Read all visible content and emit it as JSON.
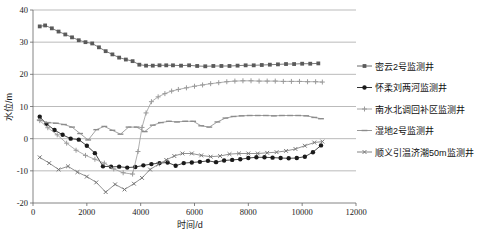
{
  "chart_data": {
    "type": "line",
    "title": "",
    "xlabel": "时间/d",
    "ylabel": "水位/m",
    "xlim": [
      0,
      12000
    ],
    "ylim": [
      -20,
      40
    ],
    "xticks": [
      0,
      2000,
      4000,
      6000,
      8000,
      10000,
      12000
    ],
    "yticks": [
      -20,
      -10,
      0,
      10,
      20,
      30,
      40
    ],
    "xticklabels": [
      "0",
      "2000",
      "4000",
      "6000",
      "8000",
      "10000",
      "12000"
    ],
    "yticklabels": [
      "-20",
      "-10",
      "0",
      "10",
      "20",
      "30",
      "40"
    ],
    "grid": "horizontal",
    "legend_position": "right",
    "series": [
      {
        "name": "密云2号监测井",
        "color": "#5a5a5a",
        "marker": "square",
        "x": [
          250,
          450,
          700,
          950,
          1200,
          1450,
          1700,
          1950,
          2200,
          2450,
          2700,
          2950,
          3200,
          3450,
          3700,
          3950,
          4200,
          4450,
          4700,
          4950,
          5200,
          5500,
          5800,
          6100,
          6400,
          6700,
          7000,
          7300,
          7600,
          7900,
          8200,
          8500,
          8800,
          9100,
          9400,
          9700,
          10000,
          10300,
          10600
        ],
        "y": [
          34.9,
          35.2,
          34.3,
          33.3,
          32.4,
          31.5,
          30.6,
          30.0,
          29.6,
          28.4,
          27.2,
          26.2,
          25.2,
          24.6,
          24.1,
          23.0,
          22.7,
          22.7,
          22.8,
          22.8,
          22.8,
          22.7,
          22.8,
          22.6,
          22.5,
          22.6,
          22.6,
          22.6,
          22.7,
          22.8,
          22.8,
          22.9,
          23.0,
          23.1,
          23.2,
          23.2,
          23.3,
          23.3,
          23.4
        ]
      },
      {
        "name": "怀柔刘两河监测井",
        "color": "#1a1a1a",
        "marker": "circle",
        "x": [
          250,
          500,
          800,
          1100,
          1400,
          1700,
          2000,
          2300,
          2600,
          2900,
          3200,
          3500,
          3800,
          4100,
          4400,
          4700,
          5000,
          5300,
          5600,
          5900,
          6200,
          6500,
          6800,
          7100,
          7400,
          7700,
          8000,
          8300,
          8600,
          8900,
          9200,
          9500,
          9800,
          10100,
          10400,
          10700
        ],
        "y": [
          6.8,
          4.6,
          2.7,
          1.2,
          0.0,
          -0.3,
          -2.2,
          -4.5,
          -8.6,
          -8.7,
          -8.7,
          -9.0,
          -8.8,
          -8.3,
          -7.9,
          -7.6,
          -7.4,
          -8.4,
          -7.6,
          -7.4,
          -7.2,
          -6.9,
          -7.3,
          -6.8,
          -6.6,
          -6.4,
          -6.0,
          -5.8,
          -5.8,
          -5.9,
          -6.0,
          -6.1,
          -6.0,
          -5.6,
          -4.2,
          -2.1
        ]
      },
      {
        "name": "南水北调回补区监测井",
        "color": "#9a9a9a",
        "marker": "plus",
        "x": [
          250,
          550,
          900,
          1250,
          1600,
          1950,
          2300,
          2650,
          3000,
          3350,
          3700,
          3900,
          4050,
          4200,
          4400,
          4650,
          4900,
          5150,
          5400,
          5700,
          6000,
          6300,
          6600,
          6900,
          7200,
          7500,
          7800,
          8100,
          8400,
          8700,
          9000,
          9300,
          9600,
          9900,
          10200,
          10500,
          10750
        ],
        "y": [
          5.6,
          3.4,
          1.2,
          -1.4,
          -3.6,
          -5.2,
          -6.4,
          -7.6,
          -9.4,
          -10.6,
          -11.0,
          -4.0,
          3.5,
          8.0,
          11.5,
          13.0,
          14.0,
          14.8,
          15.3,
          15.8,
          16.3,
          16.7,
          17.1,
          17.4,
          17.7,
          17.9,
          18.0,
          18.0,
          17.9,
          17.9,
          17.9,
          17.8,
          17.8,
          17.8,
          17.7,
          17.7,
          17.6
        ]
      },
      {
        "name": "湿地2号监测井",
        "color": "#8c8c8c",
        "marker": "dash",
        "x": [
          250,
          550,
          850,
          1150,
          1450,
          1750,
          2050,
          2350,
          2650,
          2950,
          3250,
          3550,
          3850,
          4150,
          4450,
          4750,
          5050,
          5350,
          5650,
          5950,
          6250,
          6550,
          6850,
          7150,
          7450,
          7750,
          8050,
          8350,
          8650,
          8950,
          9250,
          9550,
          9850,
          10150,
          10450,
          10700
        ],
        "y": [
          5.8,
          5.0,
          4.8,
          4.4,
          3.6,
          1.6,
          -0.4,
          2.8,
          3.8,
          2.6,
          1.4,
          3.6,
          3.6,
          2.2,
          4.2,
          5.0,
          5.4,
          5.2,
          5.4,
          5.4,
          4.0,
          3.6,
          5.2,
          6.4,
          6.9,
          7.1,
          7.2,
          7.2,
          7.2,
          7.1,
          7.2,
          7.2,
          7.2,
          7.1,
          6.6,
          6.2
        ]
      },
      {
        "name": "顺义引温济潮50m监测井",
        "color": "#777777",
        "marker": "x",
        "x": [
          250,
          600,
          950,
          1300,
          1650,
          2000,
          2350,
          2700,
          3050,
          3400,
          3750,
          4050,
          4350,
          4650,
          4950,
          5250,
          5550,
          5900,
          6250,
          6600,
          6950,
          7300,
          7650,
          8000,
          8350,
          8700,
          9050,
          9400,
          9750,
          10100,
          10450,
          10750
        ],
        "y": [
          -5.8,
          -7.6,
          -9.6,
          -8.6,
          -10.4,
          -11.8,
          -13.6,
          -16.6,
          -14.2,
          -15.8,
          -14.0,
          -12.2,
          -9.6,
          -8.0,
          -6.6,
          -5.4,
          -4.6,
          -4.6,
          -5.2,
          -5.6,
          -5.4,
          -4.8,
          -4.6,
          -4.6,
          -4.6,
          -4.4,
          -4.2,
          -3.8,
          -3.2,
          -2.2,
          -1.2,
          -0.9
        ]
      }
    ]
  },
  "legend": {
    "items": [
      {
        "label": "密云2号监测井"
      },
      {
        "label": "怀柔刘两河监测井"
      },
      {
        "label": "南水北调回补区监测井"
      },
      {
        "label": "湿地2号监测井"
      },
      {
        "label": "顺义引温济潮50m监测井"
      }
    ]
  }
}
